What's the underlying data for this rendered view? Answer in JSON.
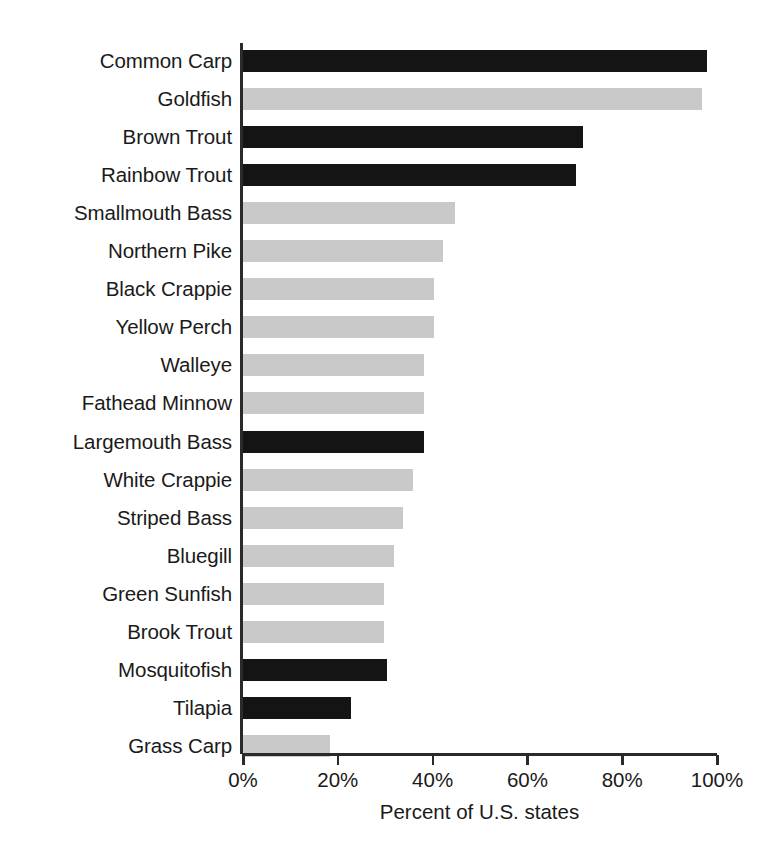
{
  "chart_data": {
    "type": "bar",
    "orientation": "horizontal",
    "title": "",
    "subtitle": "",
    "xlabel": "Percent of U.S. states",
    "ylabel": "",
    "xlim": [
      0,
      100
    ],
    "xticks": [
      0,
      20,
      40,
      60,
      80,
      100
    ],
    "xtick_labels": [
      "0%",
      "20%",
      "40%",
      "60%",
      "80%",
      "100%"
    ],
    "grid": false,
    "legend": null,
    "colors": {
      "dark": "#141414",
      "light": "#c9c9c9",
      "axis": "#2a2a2a",
      "background": "#ffffff",
      "text": "#1a1a1a"
    },
    "categories": [
      "Common Carp",
      "Goldfish",
      "Brown Trout",
      "Rainbow Trout",
      "Smallmouth Bass",
      "Northern Pike",
      "Black Crappie",
      "Yellow Perch",
      "Walleye",
      "Fathead Minnow",
      "Largemouth Bass",
      "White Crappie",
      "Striped Bass",
      "Bluegill",
      "Green Sunfish",
      "Brook Trout",
      "Mosquitofish",
      "Tilapia",
      "Grass Carp"
    ],
    "values": [
      98,
      97,
      72,
      70.5,
      45,
      42.5,
      40.5,
      40.5,
      38.5,
      38.5,
      38.5,
      36,
      34,
      32,
      30,
      30,
      30.5,
      23,
      18.5
    ],
    "bar_colors": [
      "dark",
      "light",
      "dark",
      "dark",
      "light",
      "light",
      "light",
      "light",
      "light",
      "light",
      "dark",
      "light",
      "light",
      "light",
      "light",
      "light",
      "dark",
      "dark",
      "light"
    ],
    "bars": [
      {
        "label": "Common Carp",
        "value": 98,
        "color": "dark"
      },
      {
        "label": "Goldfish",
        "value": 97,
        "color": "light"
      },
      {
        "label": "Brown Trout",
        "value": 72,
        "color": "dark"
      },
      {
        "label": "Rainbow Trout",
        "value": 70.5,
        "color": "dark"
      },
      {
        "label": "Smallmouth Bass",
        "value": 45,
        "color": "light"
      },
      {
        "label": "Northern Pike",
        "value": 42.5,
        "color": "light"
      },
      {
        "label": "Black Crappie",
        "value": 40.5,
        "color": "light"
      },
      {
        "label": "Yellow Perch",
        "value": 40.5,
        "color": "light"
      },
      {
        "label": "Walleye",
        "value": 38.5,
        "color": "light"
      },
      {
        "label": "Fathead Minnow",
        "value": 38.5,
        "color": "light"
      },
      {
        "label": "Largemouth Bass",
        "value": 38.5,
        "color": "dark"
      },
      {
        "label": "White Crappie",
        "value": 36,
        "color": "light"
      },
      {
        "label": "Striped Bass",
        "value": 34,
        "color": "light"
      },
      {
        "label": "Bluegill",
        "value": 32,
        "color": "light"
      },
      {
        "label": "Green Sunfish",
        "value": 30,
        "color": "light"
      },
      {
        "label": "Brook Trout",
        "value": 30,
        "color": "light"
      },
      {
        "label": "Mosquitofish",
        "value": 30.5,
        "color": "dark"
      },
      {
        "label": "Tilapia",
        "value": 23,
        "color": "dark"
      },
      {
        "label": "Grass Carp",
        "value": 18.5,
        "color": "light"
      }
    ]
  }
}
